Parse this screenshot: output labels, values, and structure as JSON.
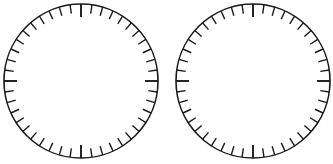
{
  "figure": {
    "name": "twin-tick-dial-rings",
    "background_color": "#ffffff",
    "stroke_color": "#1a1a1a",
    "width": 333,
    "height": 164
  },
  "chart_data": {
    "type": "scatter",
    "title": "",
    "subtitle": "",
    "xlabel": "",
    "ylabel": "",
    "grid": false,
    "legend_position": "none",
    "tick_labels": [],
    "annotations": [],
    "series": [
      {
        "name": "dial-left",
        "center_x": 81,
        "center_y": 81,
        "radius": 77,
        "tick_count": 44,
        "tick_length": 9,
        "major_tick_length": 13,
        "major_tick_indices": [
          0,
          11,
          22,
          33
        ],
        "start_angle_deg": -90,
        "values": [
          0,
          1,
          2,
          3,
          4,
          5,
          6,
          7,
          8,
          9,
          10,
          11,
          12,
          13,
          14,
          15,
          16,
          17,
          18,
          19,
          20,
          21,
          22,
          23,
          24,
          25,
          26,
          27,
          28,
          29,
          30,
          31,
          32,
          33,
          34,
          35,
          36,
          37,
          38,
          39,
          40,
          41,
          42,
          43
        ]
      },
      {
        "name": "dial-right",
        "center_x": 81,
        "center_y": 81,
        "radius": 77,
        "tick_count": 44,
        "tick_length": 9,
        "major_tick_length": 13,
        "major_tick_indices": [
          0,
          11,
          22,
          33
        ],
        "start_angle_deg": -90,
        "values": [
          0,
          1,
          2,
          3,
          4,
          5,
          6,
          7,
          8,
          9,
          10,
          11,
          12,
          13,
          14,
          15,
          16,
          17,
          18,
          19,
          20,
          21,
          22,
          23,
          24,
          25,
          26,
          27,
          28,
          29,
          30,
          31,
          32,
          33,
          34,
          35,
          36,
          37,
          38,
          39,
          40,
          41,
          42,
          43
        ]
      }
    ],
    "xlim": [
      0,
      333
    ],
    "ylim": [
      0,
      164
    ]
  }
}
